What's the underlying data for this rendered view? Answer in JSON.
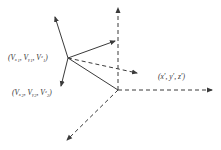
{
  "diagram": {
    "type": "vector-coordinate-transformation",
    "labels": {
      "point1": "(Vₓ₁, Vᵧ₁, Vᶻ₁)",
      "point2": "(Vₓ₂, Vᵧ₂, Vᶻ₂)",
      "origin": "(x′, y′, z′)"
    },
    "points": {
      "p1": [
        68,
        58
      ],
      "origin": [
        118,
        90
      ]
    },
    "solid_vectors": [
      {
        "name": "p1-axis-up-left",
        "from": [
          68,
          58
        ],
        "to": [
          55,
          17
        ]
      },
      {
        "name": "p1-axis-up-right",
        "from": [
          68,
          58
        ],
        "to": [
          115,
          41
        ]
      },
      {
        "name": "p1-axis-down",
        "from": [
          68,
          58
        ],
        "to": [
          61,
          86
        ]
      }
    ],
    "solid_lines": [
      {
        "name": "p1-to-origin",
        "from": [
          68,
          58
        ],
        "to": [
          118,
          90
        ]
      }
    ],
    "dashed_vectors": [
      {
        "name": "p1-projection",
        "from": [
          68,
          58
        ],
        "to": [
          137,
          73
        ]
      },
      {
        "name": "origin-axis-up",
        "from": [
          118,
          90
        ],
        "to": [
          118,
          8
        ]
      },
      {
        "name": "origin-axis-right",
        "from": [
          118,
          90
        ],
        "to": [
          212,
          90
        ]
      },
      {
        "name": "origin-axis-down-left",
        "from": [
          118,
          90
        ],
        "to": [
          67,
          140
        ]
      }
    ],
    "colors": {
      "line": "#3a3a3a",
      "text": "#333333",
      "background": "#ffffff"
    }
  }
}
